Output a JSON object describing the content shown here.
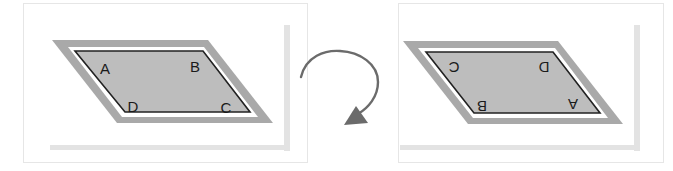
{
  "diagram": {
    "colors": {
      "outer_band": "#a9a9a9",
      "fill": "#bdbdbd",
      "inner_border": "#222222",
      "white_gap": "#ffffff",
      "frame": "#e6e6e6",
      "deco_bar": "#e3e3e3",
      "arrow": "#6b6b6b"
    },
    "original": {
      "vertices": {
        "top_left": "A",
        "top_right": "B",
        "bottom_left": "D",
        "bottom_right": "C"
      }
    },
    "rotation_arrow": {
      "direction": "clockwise",
      "icon": "rotate-arrow-icon"
    },
    "rotated": {
      "vertices": {
        "top_left": "C",
        "top_right": "D",
        "bottom_left": "B",
        "bottom_right": "A"
      },
      "letters_upside_down": true
    }
  }
}
